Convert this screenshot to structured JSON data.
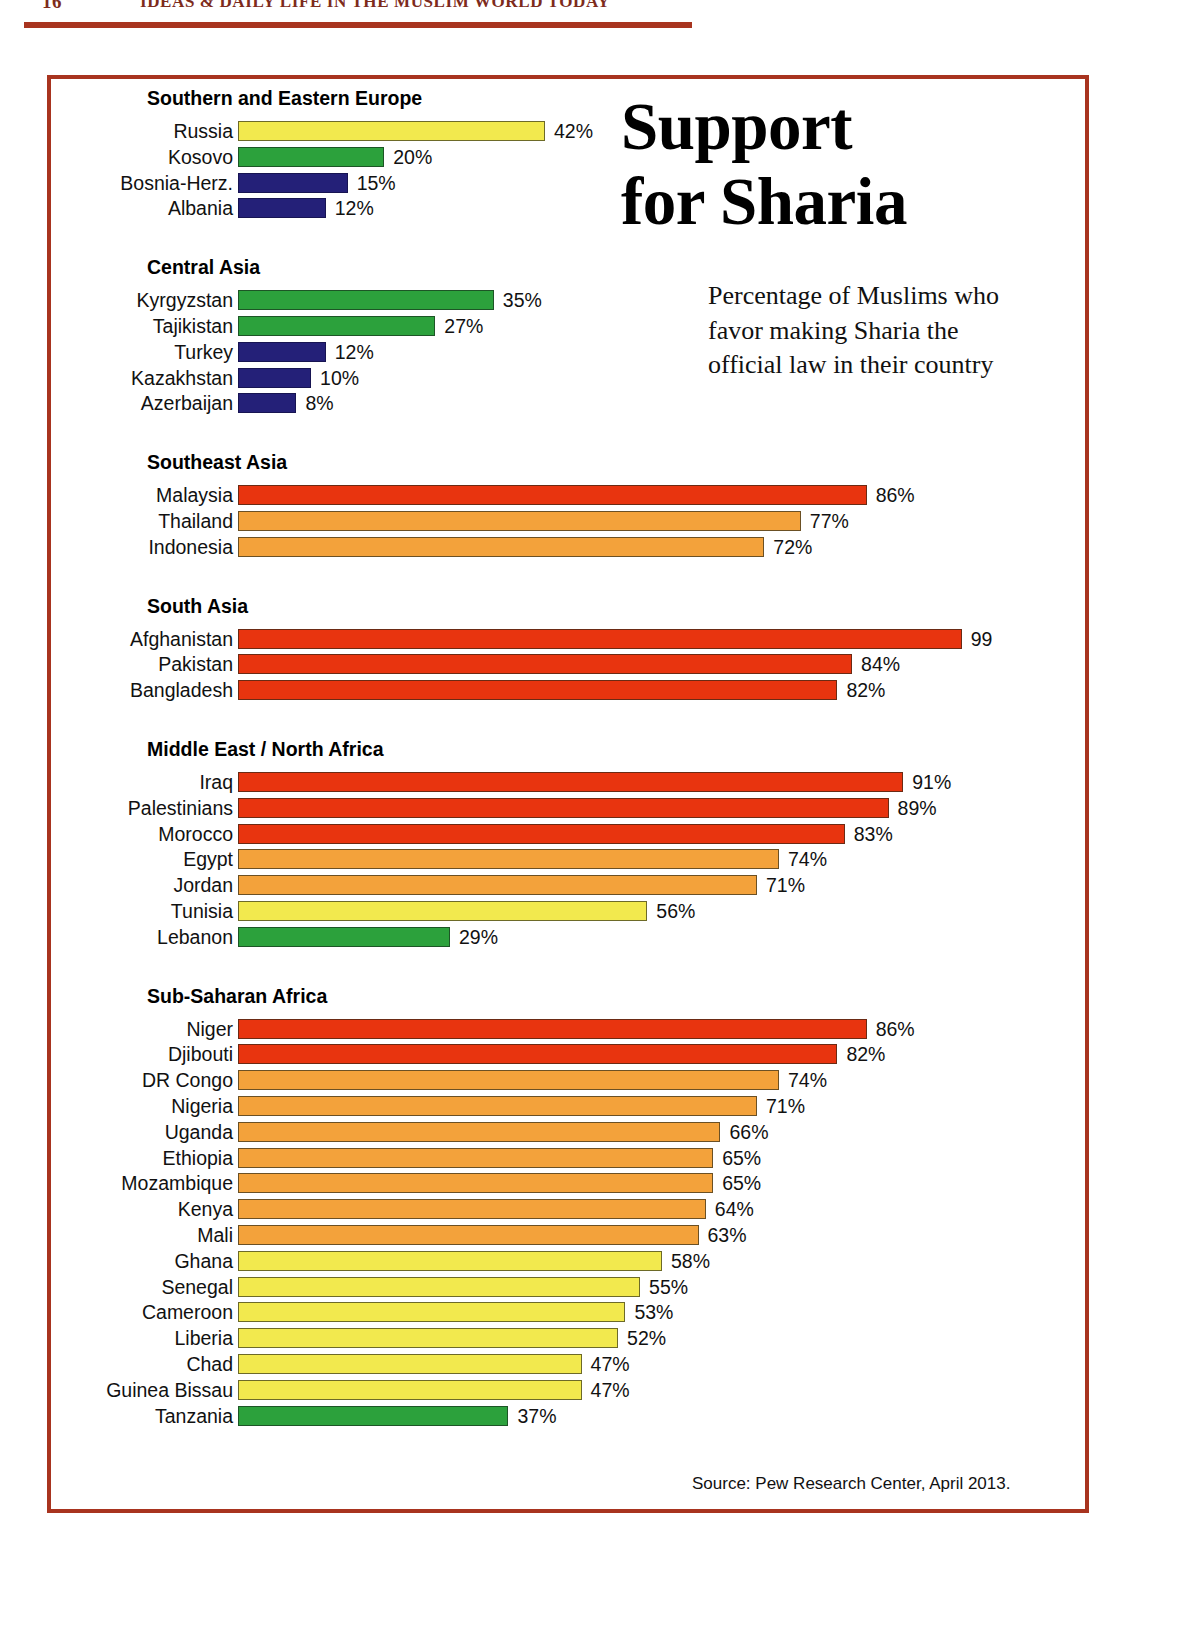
{
  "running_head": {
    "folio": "16",
    "title": "IDEAS & DAILY LIFE IN THE MUSLIM WORLD TODAY"
  },
  "headline": {
    "line1": "Support",
    "line2": "for Sharia"
  },
  "standfirst": "Percentage of Muslims who favor making Sharia the official law in their country",
  "source": "Source: Pew Research Center, April 2013.",
  "palette": {
    "frame": "#a8341f",
    "rule": "#a8341f",
    "red": "#e8340f",
    "orange": "#f3a23b",
    "yellow": "#f2e94e",
    "green": "#2ca13c",
    "navy": "#242078"
  },
  "chart_data": {
    "type": "bar",
    "title": "Support for Sharia",
    "subtitle": "Percentage of Muslims who favor making Sharia the official law in their country",
    "xlabel": "",
    "ylabel": "",
    "xlim": [
      0,
      100
    ],
    "grid": false,
    "legend": "none",
    "orientation": "horizontal",
    "units": "percent",
    "source": "Source: Pew Research Center, April 2013.",
    "color_bands": [
      {
        "color": "#e8340f",
        "name": "red",
        "range": "80-100"
      },
      {
        "color": "#f3a23b",
        "name": "orange",
        "range": "60-79"
      },
      {
        "color": "#f2e94e",
        "name": "yellow",
        "range": "40-59"
      },
      {
        "color": "#2ca13c",
        "name": "green",
        "range": "20-39"
      },
      {
        "color": "#242078",
        "name": "navy",
        "range": "0-19"
      }
    ],
    "groups": [
      {
        "name": "Southern and Eastern Europe",
        "items": [
          {
            "label": "Russia",
            "value": 42,
            "display": "42%",
            "color": "yellow"
          },
          {
            "label": "Kosovo",
            "value": 20,
            "display": "20%",
            "color": "green"
          },
          {
            "label": "Bosnia-Herz.",
            "value": 15,
            "display": "15%",
            "color": "navy"
          },
          {
            "label": "Albania",
            "value": 12,
            "display": "12%",
            "color": "navy"
          }
        ]
      },
      {
        "name": "Central Asia",
        "items": [
          {
            "label": "Kyrgyzstan",
            "value": 35,
            "display": "35%",
            "color": "green"
          },
          {
            "label": "Tajikistan",
            "value": 27,
            "display": "27%",
            "color": "green"
          },
          {
            "label": "Turkey",
            "value": 12,
            "display": "12%",
            "color": "navy"
          },
          {
            "label": "Kazakhstan",
            "value": 10,
            "display": "10%",
            "color": "navy"
          },
          {
            "label": "Azerbaijan",
            "value": 8,
            "display": "8%",
            "color": "navy"
          }
        ]
      },
      {
        "name": "Southeast Asia",
        "items": [
          {
            "label": "Malaysia",
            "value": 86,
            "display": "86%",
            "color": "red"
          },
          {
            "label": "Thailand",
            "value": 77,
            "display": "77%",
            "color": "orange"
          },
          {
            "label": "Indonesia",
            "value": 72,
            "display": "72%",
            "color": "orange"
          }
        ]
      },
      {
        "name": "South Asia",
        "items": [
          {
            "label": "Afghanistan",
            "value": 99,
            "display": "99",
            "color": "red"
          },
          {
            "label": "Pakistan",
            "value": 84,
            "display": "84%",
            "color": "red"
          },
          {
            "label": "Bangladesh",
            "value": 82,
            "display": "82%",
            "color": "red"
          }
        ]
      },
      {
        "name": "Middle East / North Africa",
        "items": [
          {
            "label": "Iraq",
            "value": 91,
            "display": "91%",
            "color": "red"
          },
          {
            "label": "Palestinians",
            "value": 89,
            "display": "89%",
            "color": "red"
          },
          {
            "label": "Morocco",
            "value": 83,
            "display": "83%",
            "color": "red"
          },
          {
            "label": "Egypt",
            "value": 74,
            "display": "74%",
            "color": "orange"
          },
          {
            "label": "Jordan",
            "value": 71,
            "display": "71%",
            "color": "orange"
          },
          {
            "label": "Tunisia",
            "value": 56,
            "display": "56%",
            "color": "yellow"
          },
          {
            "label": "Lebanon",
            "value": 29,
            "display": "29%",
            "color": "green"
          }
        ]
      },
      {
        "name": "Sub-Saharan Africa",
        "items": [
          {
            "label": "Niger",
            "value": 86,
            "display": "86%",
            "color": "red"
          },
          {
            "label": "Djibouti",
            "value": 82,
            "display": "82%",
            "color": "red"
          },
          {
            "label": "DR Congo",
            "value": 74,
            "display": "74%",
            "color": "orange"
          },
          {
            "label": "Nigeria",
            "value": 71,
            "display": "71%",
            "color": "orange"
          },
          {
            "label": "Uganda",
            "value": 66,
            "display": "66%",
            "color": "orange"
          },
          {
            "label": "Ethiopia",
            "value": 65,
            "display": "65%",
            "color": "orange"
          },
          {
            "label": "Mozambique",
            "value": 65,
            "display": "65%",
            "color": "orange"
          },
          {
            "label": "Kenya",
            "value": 64,
            "display": "64%",
            "color": "orange"
          },
          {
            "label": "Mali",
            "value": 63,
            "display": "63%",
            "color": "orange"
          },
          {
            "label": "Ghana",
            "value": 58,
            "display": "58%",
            "color": "yellow"
          },
          {
            "label": "Senegal",
            "value": 55,
            "display": "55%",
            "color": "yellow"
          },
          {
            "label": "Cameroon",
            "value": 53,
            "display": "53%",
            "color": "yellow"
          },
          {
            "label": "Liberia",
            "value": 52,
            "display": "52%",
            "color": "yellow"
          },
          {
            "label": "Chad",
            "value": 47,
            "display": "47%",
            "color": "yellow"
          },
          {
            "label": "Guinea Bissau",
            "value": 47,
            "display": "47%",
            "color": "yellow"
          },
          {
            "label": "Tanzania",
            "value": 37,
            "display": "37%",
            "color": "green"
          }
        ]
      }
    ]
  }
}
